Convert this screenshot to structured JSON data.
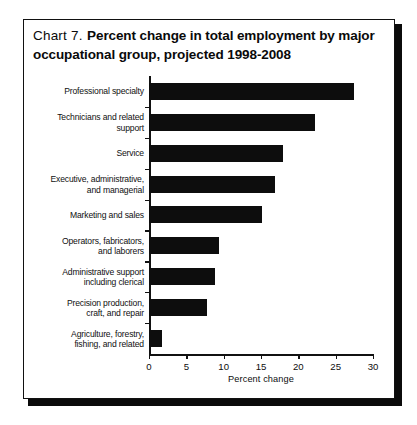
{
  "figure": {
    "label": "Chart 7.",
    "title": "Percent change in total employment by major occupational group, projected 1998-2008"
  },
  "chart_data": {
    "type": "bar",
    "orientation": "horizontal",
    "title": "Chart 7.  Percent change in total employment by major occupational group, projected 1998-2008",
    "xlabel": "Percent change",
    "ylabel": "",
    "xlim": [
      0,
      30
    ],
    "xticks": [
      0,
      5,
      10,
      15,
      20,
      25,
      30
    ],
    "grid": false,
    "legend": false,
    "bar_color": "#0d0d0d",
    "categories": [
      "Professional specialty",
      "Technicians and related\nsupport",
      "Service",
      "Executive, administrative,\nand managerial",
      "Marketing and sales",
      "Operators, fabricators,\nand laborers",
      "Administrative support\nincluding clerical",
      "Precision production,\ncraft, and repair",
      "Agriculture, forestry,\nfishing, and related"
    ],
    "values": [
      27.5,
      22.2,
      17.9,
      16.9,
      15.1,
      9.4,
      8.9,
      7.8,
      1.8
    ]
  },
  "axis": {
    "x_title": "Percent change",
    "tick_labels": [
      "0",
      "5",
      "10",
      "15",
      "20",
      "25",
      "30"
    ]
  }
}
